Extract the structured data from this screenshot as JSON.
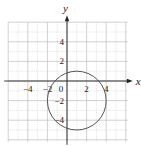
{
  "chart_data": {
    "type": "line",
    "title": "",
    "xlabel": "x",
    "ylabel": "y",
    "xlim": [
      -6,
      6
    ],
    "ylim": [
      -6,
      6
    ],
    "grid": true,
    "x_ticks": [
      {
        "value": -4,
        "label": "−4"
      },
      {
        "value": -2,
        "label": "−2"
      },
      {
        "value": 0,
        "label": "0"
      },
      {
        "value": 2,
        "label": "2"
      },
      {
        "value": 4,
        "label": "4"
      }
    ],
    "y_ticks": [
      {
        "value": 4,
        "label": "4"
      },
      {
        "value": 2,
        "label": "2"
      },
      {
        "value": -2,
        "label": "−2"
      },
      {
        "value": -4,
        "label": "−4"
      }
    ],
    "series": [
      {
        "name": "circle",
        "shape": "circle",
        "center": [
          1,
          -2
        ],
        "radius": 3,
        "equation": "(x - 1)^2 + (y + 2)^2 = 9"
      }
    ]
  }
}
